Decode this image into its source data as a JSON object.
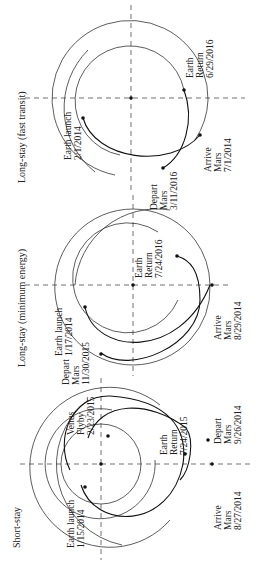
{
  "figure": {
    "panels": [
      {
        "id": "short-stay",
        "title": "Short-stay",
        "labels": {
          "earth_launch": [
            "Earth launch",
            "1/15/2014"
          ],
          "venus_flyby": [
            "Venus",
            "Flyby",
            "2/23/2015"
          ],
          "earth_return": [
            "Earth",
            "Return",
            "7/24/2015"
          ],
          "depart_mars": [
            "Depart",
            "Mars",
            "9/26/2014"
          ],
          "arrive_mars": [
            "Arrive",
            "Mars",
            "8/27/2014"
          ]
        }
      },
      {
        "id": "long-stay-min-energy",
        "title": "Long-stay (minimum energy)",
        "labels": {
          "earth_launch": [
            "Earth launch",
            "1/17/2014"
          ],
          "depart_mars": [
            "Depart",
            "Mars",
            "11/30/2015"
          ],
          "earth_return": [
            "Earth",
            "Return",
            "7/24/2016"
          ],
          "arrive_mars": [
            "Arrive",
            "Mars",
            "8/29/2014"
          ]
        }
      },
      {
        "id": "long-stay-fast-transit",
        "title": "Long-stay (fast transit)",
        "labels": {
          "earth_launch": [
            "Earth launch",
            "2/1/2014"
          ],
          "depart_mars": [
            "Depart",
            "Mars",
            "3/11/2016"
          ],
          "earth_return": [
            "Earth",
            "Return",
            "6/29/2016"
          ],
          "arrive_mars": [
            "Arrive",
            "Mars",
            "7/1/2014"
          ]
        }
      }
    ]
  }
}
